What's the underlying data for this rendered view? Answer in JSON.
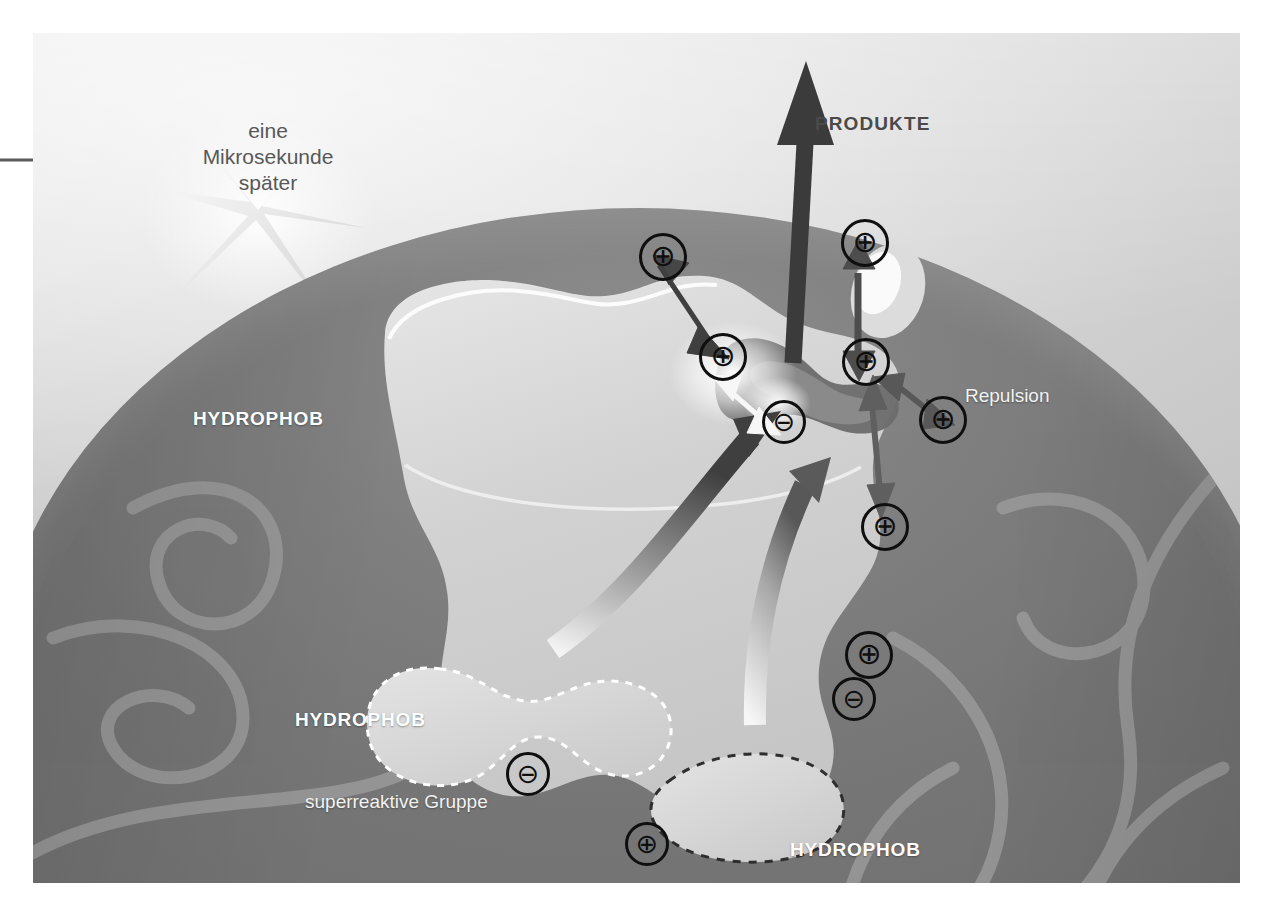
{
  "figure": {
    "kind": "scientific-illustration",
    "language": "de",
    "background_color": "#ffffff",
    "panel_color": "#7e7e7e"
  },
  "labels": {
    "timing": {
      "line1": "eine",
      "line2": "Mikrosekunde",
      "line3": "später"
    },
    "products": "PRODUKTE",
    "repulsion": "Repulsion",
    "hydrophob_upper_left": "HYDROPHOB",
    "hydrophob_lower_left": "HYDROPHOB",
    "hydrophob_lower_right": "HYDROPHOB",
    "superreactive_group": "superreaktive Gruppe"
  },
  "charges": [
    {
      "id": "plus-upper-left",
      "symbol": "⊕",
      "x": 639,
      "y": 233,
      "size": 42
    },
    {
      "id": "plus-center-left",
      "symbol": "⊕",
      "x": 699,
      "y": 333,
      "size": 42
    },
    {
      "id": "minus-center",
      "symbol": "⊖",
      "x": 762,
      "y": 400,
      "size": 38
    },
    {
      "id": "plus-top-right",
      "symbol": "⊕",
      "x": 841,
      "y": 219,
      "size": 42
    },
    {
      "id": "plus-center-right",
      "symbol": "⊕",
      "x": 842,
      "y": 338,
      "size": 42
    },
    {
      "id": "plus-far-right",
      "symbol": "⊕",
      "x": 919,
      "y": 396,
      "size": 42
    },
    {
      "id": "plus-lower-right",
      "symbol": "⊕",
      "x": 861,
      "y": 503,
      "size": 42
    },
    {
      "id": "plus-outer-right",
      "symbol": "⊕",
      "x": 845,
      "y": 631,
      "size": 42
    },
    {
      "id": "minus-outer-right",
      "symbol": "⊖",
      "x": 832,
      "y": 677,
      "size": 38
    },
    {
      "id": "minus-bottom-left",
      "symbol": "⊖",
      "x": 506,
      "y": 752,
      "size": 38
    },
    {
      "id": "plus-bottom",
      "symbol": "⊕",
      "x": 625,
      "y": 822,
      "size": 38
    }
  ],
  "colors": {
    "ink": "#0f0f0f",
    "label_white": "#ffffff",
    "label_dark": "#4a4a4a",
    "protein_dark": "#7e7e7e",
    "enzyme_light": "#d6d6d6",
    "background_light": "#e8e8e8"
  }
}
